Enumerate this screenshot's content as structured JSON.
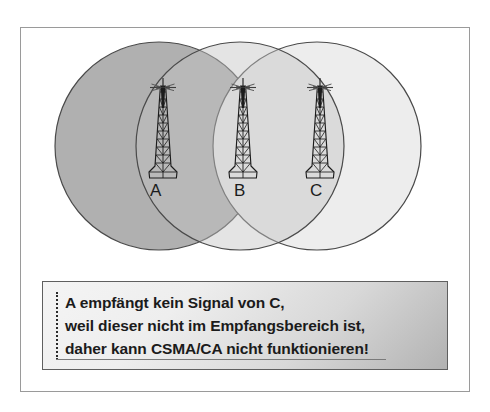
{
  "figure": {
    "frame": {
      "border_color": "#9a9a9a"
    }
  },
  "coverage": {
    "circles": [
      {
        "id": "circle-a",
        "station": "A",
        "cx": 159,
        "cy": 146,
        "r": 104,
        "fill": "#b0b0b0",
        "stroke": "#4a4a4a"
      },
      {
        "id": "circle-b",
        "station": "B",
        "cx": 240,
        "cy": 146,
        "r": 104,
        "fill": "#cfcfcf",
        "stroke": "#4a4a4a"
      },
      {
        "id": "circle-c",
        "station": "C",
        "cx": 317,
        "cy": 146,
        "r": 104,
        "fill": "#ededed",
        "stroke": "#4a4a4a"
      }
    ]
  },
  "stations": [
    {
      "id": "station-a",
      "label": "A",
      "tower_x": 163,
      "tower_y": 80,
      "label_x": 150,
      "label_y": 181
    },
    {
      "id": "station-b",
      "label": "B",
      "tower_x": 243,
      "tower_y": 80,
      "label_x": 234,
      "label_y": 181
    },
    {
      "id": "station-c",
      "label": "C",
      "tower_x": 320,
      "tower_y": 80,
      "label_x": 310,
      "label_y": 181
    }
  ],
  "caption": {
    "lines": [
      "A empfängt kein Signal von C,",
      "weil dieser nicht im Empfangsbereich ist,",
      "daher kann CSMA/CA nicht funktionieren!"
    ],
    "border_color": "#5f5f5f",
    "text_color": "#1b1b1b"
  },
  "icons": {
    "tower": "radio-tower-icon",
    "antenna": "antenna-icon"
  },
  "colors": {
    "frame_border": "#9a9a9a",
    "circle_stroke": "#4a4a4a",
    "circle_a_fill": "#b0b0b0",
    "circle_b_fill": "#cfcfcf",
    "circle_c_fill": "#ededed",
    "label_text": "#1c1c1c",
    "caption_text": "#1b1b1b"
  }
}
